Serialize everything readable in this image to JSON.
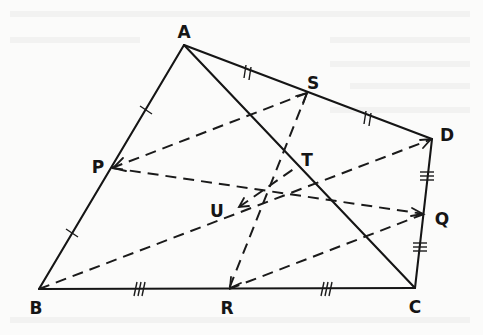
{
  "figure": {
    "points": {
      "A": {
        "x": 184,
        "y": 45,
        "label": "A",
        "lx": 184,
        "ly": 38
      },
      "B": {
        "x": 39,
        "y": 289,
        "label": "B",
        "lx": 36,
        "ly": 314
      },
      "C": {
        "x": 415,
        "y": 288,
        "label": "C",
        "lx": 415,
        "ly": 313
      },
      "D": {
        "x": 432,
        "y": 139,
        "label": "D",
        "lx": 447,
        "ly": 141
      },
      "P": {
        "x": 112,
        "y": 168,
        "label": "P",
        "lx": 98,
        "ly": 173
      },
      "Q": {
        "x": 424,
        "y": 214,
        "label": "Q",
        "lx": 442,
        "ly": 225
      },
      "R": {
        "x": 229,
        "y": 289,
        "label": "R",
        "lx": 227,
        "ly": 314
      },
      "S": {
        "x": 307,
        "y": 93,
        "label": "S",
        "lx": 313,
        "ly": 89
      },
      "T": {
        "x": 298,
        "y": 166,
        "label": "T",
        "lx": 307,
        "ly": 166
      },
      "U": {
        "x": 239,
        "y": 207,
        "label": "U",
        "lx": 217,
        "ly": 217
      }
    },
    "solid_segments": [
      [
        "A",
        "B"
      ],
      [
        "B",
        "C"
      ],
      [
        "C",
        "D"
      ],
      [
        "D",
        "A"
      ],
      [
        "A",
        "C"
      ]
    ],
    "dashed_segments": [
      [
        "P",
        "S"
      ],
      [
        "P",
        "Q"
      ],
      [
        "S",
        "R"
      ],
      [
        "R",
        "Q"
      ],
      [
        "B",
        "D"
      ],
      [
        "U",
        "T"
      ]
    ],
    "equal_marks": [
      {
        "segment": "AP",
        "ticks": 1
      },
      {
        "segment": "PB",
        "ticks": 1
      },
      {
        "segment": "AS",
        "ticks": 2
      },
      {
        "segment": "SD",
        "ticks": 2
      },
      {
        "segment": "DQ",
        "ticks": 3
      },
      {
        "segment": "QC",
        "ticks": 3
      },
      {
        "segment": "BR",
        "ticks": 3
      },
      {
        "segment": "RC",
        "ticks": 3
      }
    ],
    "labels": [
      "A",
      "B",
      "C",
      "D",
      "P",
      "Q",
      "R",
      "S",
      "T",
      "U"
    ]
  }
}
